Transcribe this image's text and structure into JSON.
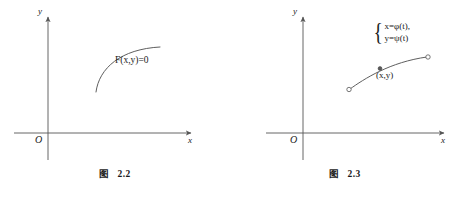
{
  "page": {
    "background": "#ffffff",
    "ink": "#1a1a1a",
    "width": 460,
    "height": 197
  },
  "figures": [
    {
      "id": "fig-2-2",
      "caption_prefix": "图",
      "caption_number": "2.2",
      "axes": {
        "x_label": "x",
        "y_label": "y",
        "origin_label": "O",
        "x_axis_y": 133,
        "y_axis_x": 48,
        "x_min": 14,
        "x_max": 196,
        "y_min": 12,
        "y_max": 160
      },
      "curve_label": "F(x,y)=0",
      "curve": {
        "type": "implicit-arc",
        "path": "M 96 92 C 100 66, 122 49, 160 47",
        "stroke": "#555555",
        "stroke_width": 0.9
      }
    },
    {
      "id": "fig-2-3",
      "caption_prefix": "图",
      "caption_number": "2.3",
      "axes": {
        "x_label": "x",
        "y_label": "y",
        "origin_label": "O",
        "x_axis_y": 133,
        "y_axis_x": 73,
        "x_min": 36,
        "x_max": 218,
        "y_min": 12,
        "y_max": 160
      },
      "parametric": {
        "line1": "x=φ(t),",
        "line2": "y=ψ(t)",
        "brace": "{"
      },
      "point_label": "(x,y)",
      "curve": {
        "type": "parametric-arc",
        "path": "M 120 89 C 133 78, 158 62, 198 57",
        "stroke": "#555555",
        "stroke_width": 0.9,
        "start_point": {
          "x": 120,
          "y": 89,
          "filled": false
        },
        "end_point": {
          "x": 198,
          "y": 57,
          "filled": false
        },
        "marked_point": {
          "x": 150,
          "y": 68,
          "filled": true
        }
      }
    }
  ]
}
